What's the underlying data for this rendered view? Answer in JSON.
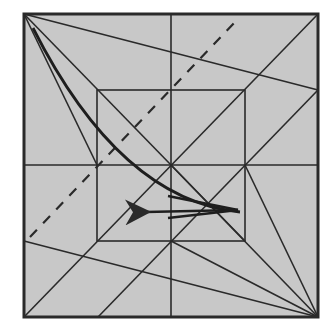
{
  "diagram": {
    "type": "origami-crease-pattern",
    "colors": {
      "paper": "#c8c8c8",
      "line": "#2a2a2a",
      "background": "#ffffff"
    },
    "outer_square": {
      "x1": 24,
      "y1": 14,
      "x2": 318,
      "y2": 317
    },
    "inner_square": {
      "x1": 97,
      "y1": 90,
      "x2": 245,
      "y2": 241
    },
    "crease_lines": [
      {
        "x1": 171,
        "y1": 14,
        "x2": 171,
        "y2": 317
      },
      {
        "x1": 24,
        "y1": 165,
        "x2": 318,
        "y2": 165
      },
      {
        "x1": 24,
        "y1": 317,
        "x2": 318,
        "y2": 14
      },
      {
        "x1": 98,
        "y1": 317,
        "x2": 318,
        "y2": 90
      },
      {
        "x1": 24,
        "y1": 14,
        "x2": 318,
        "y2": 90
      },
      {
        "x1": 24,
        "y1": 14,
        "x2": 97,
        "y2": 165
      },
      {
        "x1": 24,
        "y1": 14,
        "x2": 245,
        "y2": 241
      },
      {
        "x1": 318,
        "y1": 317,
        "x2": 245,
        "y2": 165
      },
      {
        "x1": 318,
        "y1": 317,
        "x2": 171,
        "y2": 241
      },
      {
        "x1": 318,
        "y1": 317,
        "x2": 24,
        "y2": 241
      },
      {
        "x1": 171,
        "y1": 165,
        "x2": 318,
        "y2": 317
      }
    ],
    "dashed_line": {
      "x1": 30,
      "y1": 237,
      "x2": 237,
      "y2": 20
    },
    "curved_fold": {
      "path": "M 33 28 Q 120 200 240 212"
    },
    "arrow": {
      "x1": 238,
      "y1": 210,
      "x2": 146,
      "y2": 212
    },
    "thick_lines": [
      {
        "x1": 168,
        "y1": 196,
        "x2": 238,
        "y2": 210
      },
      {
        "x1": 168,
        "y1": 218,
        "x2": 238,
        "y2": 210
      }
    ]
  }
}
